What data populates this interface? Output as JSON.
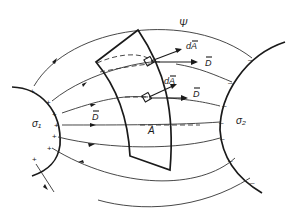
{
  "diagram": {
    "labels": {
      "flux": "Ψ",
      "sigma1": "σ₁",
      "sigma2": "σ₂",
      "surface": "A",
      "dA_upper": "dA",
      "dA_lower": "dA",
      "D_upper": "D",
      "D_lower": "D",
      "D_left": "D"
    },
    "charges": {
      "positive": "+",
      "negative": "–"
    },
    "colors": {
      "ink": "#1a1a1a",
      "background": "#ffffff"
    }
  }
}
